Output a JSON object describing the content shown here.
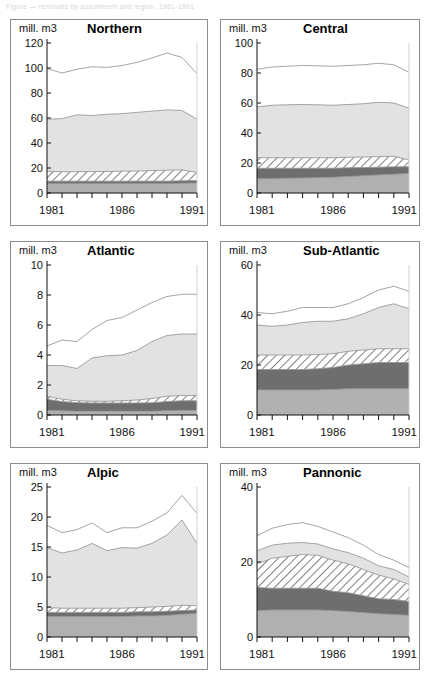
{
  "caption": {
    "text": "Figure — removals by assortment and region, 1981-1991"
  },
  "figure": {
    "unit_label": "mill. m3",
    "x_axis_ticks": [
      "1981",
      "1986",
      "1991"
    ],
    "x_years": [
      1981,
      1982,
      1983,
      1984,
      1985,
      1986,
      1987,
      1988,
      1989,
      1990,
      1991
    ],
    "palette": {
      "layer1_medium_gray": "#b0b0b0",
      "layer2_dark_gray": "#6e6e6e",
      "layer3_hatched": "#ffffff",
      "layer4_light_gray": "#e2e2e2",
      "layer5_white": "#ffffff",
      "outline": "#9a9a9a",
      "panel_border": "#8d8d8d",
      "axis": "#111111"
    },
    "layer_names": [
      "layer-1",
      "layer-2",
      "layer-3-hatched",
      "layer-4",
      "layer-5"
    ]
  },
  "chart_data": [
    {
      "type": "area",
      "title": "Northern",
      "ylabel": "mill. m3",
      "xlabel": "",
      "x": [
        1981,
        1982,
        1983,
        1984,
        1985,
        1986,
        1987,
        1988,
        1989,
        1990,
        1991
      ],
      "ylim": [
        0,
        120
      ],
      "yticks": [
        0,
        20,
        40,
        60,
        80,
        100,
        120
      ],
      "xticks": [
        1981,
        1986,
        1991
      ],
      "grid": false,
      "stacked": true,
      "series": [
        {
          "name": "layer-1",
          "values": [
            7.5,
            7.5,
            7.5,
            7.5,
            7.5,
            7.5,
            7.5,
            7.5,
            7.5,
            7.8,
            8.0
          ]
        },
        {
          "name": "layer-2",
          "values": [
            9.5,
            9.5,
            9.5,
            9.5,
            9.5,
            9.5,
            9.5,
            9.5,
            9.5,
            9.8,
            10.0
          ]
        },
        {
          "name": "layer-3-hatched",
          "values": [
            17.5,
            17.0,
            17.0,
            17.2,
            17.2,
            17.5,
            17.5,
            18.0,
            18.2,
            18.5,
            16.5
          ]
        },
        {
          "name": "layer-4",
          "values": [
            59.0,
            59.5,
            62.5,
            62.0,
            63.0,
            63.5,
            64.5,
            65.5,
            66.5,
            66.0,
            59.0
          ]
        },
        {
          "name": "layer-5",
          "values": [
            99.5,
            96.0,
            99.0,
            101.0,
            100.5,
            102.0,
            104.5,
            108.0,
            112.0,
            108.5,
            95.5
          ]
        }
      ],
      "cumulative_top_values": {
        "layer-1": [
          7.5,
          7.5,
          7.5,
          7.5,
          7.5,
          7.5,
          7.5,
          7.5,
          7.5,
          7.8,
          8.0
        ],
        "layer-5": [
          99.5,
          96.0,
          99.0,
          101.0,
          100.5,
          102.0,
          104.5,
          108.0,
          112.0,
          108.5,
          95.5
        ]
      }
    },
    {
      "type": "area",
      "title": "Central",
      "ylabel": "mill. m3",
      "xlabel": "",
      "x": [
        1981,
        1982,
        1983,
        1984,
        1985,
        1986,
        1987,
        1988,
        1989,
        1990,
        1991
      ],
      "ylim": [
        0,
        100
      ],
      "yticks": [
        0,
        20,
        40,
        60,
        80,
        100
      ],
      "xticks": [
        1981,
        1986,
        1991
      ],
      "grid": false,
      "stacked": true,
      "series": [
        {
          "name": "layer-1",
          "values": [
            9.5,
            9.5,
            9.8,
            10.0,
            10.2,
            10.5,
            11.0,
            11.5,
            12.0,
            12.5,
            13.0
          ]
        },
        {
          "name": "layer-2",
          "values": [
            16.5,
            16.5,
            16.5,
            16.5,
            16.5,
            16.5,
            16.8,
            17.0,
            17.2,
            17.5,
            17.5
          ]
        },
        {
          "name": "layer-3-hatched",
          "values": [
            23.5,
            23.5,
            23.5,
            23.5,
            23.5,
            23.5,
            23.8,
            24.0,
            24.2,
            24.5,
            22.0
          ]
        },
        {
          "name": "layer-4",
          "values": [
            57.5,
            58.5,
            58.8,
            59.0,
            58.8,
            58.5,
            59.0,
            59.5,
            60.5,
            60.0,
            56.5
          ]
        },
        {
          "name": "layer-5",
          "values": [
            82.5,
            84.0,
            84.5,
            85.0,
            84.8,
            84.5,
            85.0,
            85.5,
            86.5,
            85.5,
            80.5
          ]
        }
      ]
    },
    {
      "type": "area",
      "title": "Atlantic",
      "ylabel": "mill. m3",
      "xlabel": "",
      "x": [
        1981,
        1982,
        1983,
        1984,
        1985,
        1986,
        1987,
        1988,
        1989,
        1990,
        1991
      ],
      "ylim": [
        0,
        10
      ],
      "yticks": [
        0,
        2,
        4,
        6,
        8,
        10
      ],
      "xticks": [
        1981,
        1986,
        1991
      ],
      "grid": false,
      "stacked": true,
      "series": [
        {
          "name": "layer-1",
          "values": [
            0.3,
            0.28,
            0.25,
            0.25,
            0.25,
            0.25,
            0.25,
            0.25,
            0.28,
            0.3,
            0.3
          ]
        },
        {
          "name": "layer-2",
          "values": [
            1.05,
            0.9,
            0.82,
            0.8,
            0.8,
            0.8,
            0.8,
            0.82,
            0.9,
            0.95,
            0.95
          ]
        },
        {
          "name": "layer-3-hatched",
          "values": [
            1.25,
            1.05,
            0.95,
            0.92,
            0.92,
            0.95,
            1.0,
            1.1,
            1.25,
            1.3,
            1.3
          ]
        },
        {
          "name": "layer-4",
          "values": [
            3.3,
            3.3,
            3.1,
            3.8,
            3.95,
            4.0,
            4.3,
            4.9,
            5.3,
            5.4,
            5.4
          ]
        },
        {
          "name": "layer-5",
          "values": [
            4.6,
            5.0,
            4.9,
            5.7,
            6.3,
            6.5,
            7.0,
            7.5,
            7.9,
            8.05,
            8.05
          ]
        }
      ]
    },
    {
      "type": "area",
      "title": "Sub-Atlantic",
      "ylabel": "mill. m3",
      "xlabel": "",
      "x": [
        1981,
        1982,
        1983,
        1984,
        1985,
        1986,
        1987,
        1988,
        1989,
        1990,
        1991
      ],
      "ylim": [
        0,
        60
      ],
      "yticks": [
        0,
        20,
        40,
        60
      ],
      "xticks": [
        1981,
        1986,
        1991
      ],
      "grid": false,
      "stacked": true,
      "series": [
        {
          "name": "layer-1",
          "values": [
            10.0,
            10.0,
            10.0,
            10.0,
            10.0,
            10.2,
            10.5,
            10.5,
            10.5,
            10.5,
            10.5
          ]
        },
        {
          "name": "layer-2",
          "values": [
            18.2,
            18.2,
            18.2,
            18.2,
            18.5,
            19.0,
            20.0,
            20.5,
            21.0,
            21.0,
            21.0
          ]
        },
        {
          "name": "layer-3-hatched",
          "values": [
            24.0,
            24.0,
            24.0,
            24.0,
            24.2,
            24.5,
            25.5,
            26.0,
            26.5,
            26.5,
            26.5
          ]
        },
        {
          "name": "layer-4",
          "values": [
            36.0,
            35.5,
            36.0,
            37.0,
            37.5,
            37.5,
            38.5,
            40.5,
            43.0,
            44.5,
            42.5
          ]
        },
        {
          "name": "layer-5",
          "values": [
            41.0,
            40.5,
            41.5,
            43.0,
            43.0,
            43.0,
            44.5,
            47.0,
            50.0,
            51.5,
            49.5
          ]
        }
      ]
    },
    {
      "type": "area",
      "title": "Alpic",
      "ylabel": "mill. m3",
      "xlabel": "",
      "x": [
        1981,
        1982,
        1983,
        1984,
        1985,
        1986,
        1987,
        1988,
        1989,
        1990,
        1991
      ],
      "ylim": [
        0,
        25
      ],
      "yticks": [
        0,
        5,
        10,
        15,
        20,
        25
      ],
      "xticks": [
        1981,
        1986,
        1991
      ],
      "grid": false,
      "stacked": true,
      "series": [
        {
          "name": "layer-1",
          "values": [
            3.4,
            3.4,
            3.4,
            3.4,
            3.4,
            3.4,
            3.5,
            3.5,
            3.6,
            3.8,
            3.9
          ]
        },
        {
          "name": "layer-2",
          "values": [
            4.1,
            4.1,
            4.1,
            4.1,
            4.1,
            4.1,
            4.2,
            4.2,
            4.3,
            4.4,
            4.5
          ]
        },
        {
          "name": "layer-3-hatched",
          "values": [
            4.9,
            4.8,
            4.8,
            4.8,
            4.8,
            4.8,
            4.9,
            5.0,
            5.1,
            5.3,
            5.2
          ]
        },
        {
          "name": "layer-4",
          "values": [
            14.9,
            14.0,
            14.5,
            15.6,
            14.4,
            14.9,
            14.8,
            15.6,
            17.0,
            19.5,
            15.6
          ]
        },
        {
          "name": "layer-5",
          "values": [
            18.6,
            17.4,
            17.9,
            19.0,
            17.4,
            18.2,
            18.2,
            19.3,
            20.7,
            23.6,
            20.6
          ]
        }
      ]
    },
    {
      "type": "area",
      "title": "Pannonic",
      "ylabel": "mill. m3",
      "xlabel": "",
      "x": [
        1981,
        1982,
        1983,
        1984,
        1985,
        1986,
        1987,
        1988,
        1989,
        1990,
        1991
      ],
      "ylim": [
        0,
        40
      ],
      "yticks": [
        0,
        20,
        40
      ],
      "xticks": [
        1981,
        1986,
        1991
      ],
      "grid": false,
      "stacked": true,
      "series": [
        {
          "name": "layer-1",
          "values": [
            7.0,
            7.2,
            7.2,
            7.2,
            7.2,
            7.0,
            6.8,
            6.5,
            6.2,
            6.0,
            5.8
          ]
        },
        {
          "name": "layer-2",
          "values": [
            13.2,
            13.0,
            13.0,
            13.0,
            13.0,
            12.2,
            11.8,
            11.0,
            10.2,
            10.0,
            9.5
          ]
        },
        {
          "name": "layer-3-hatched",
          "values": [
            19.5,
            21.0,
            21.5,
            22.0,
            21.8,
            20.5,
            19.5,
            18.0,
            16.5,
            15.5,
            14.0
          ]
        },
        {
          "name": "layer-4",
          "values": [
            23.0,
            24.5,
            25.0,
            25.2,
            24.8,
            23.5,
            22.5,
            21.0,
            19.0,
            18.0,
            16.0
          ]
        },
        {
          "name": "layer-5",
          "values": [
            27.0,
            29.0,
            30.0,
            30.5,
            29.5,
            28.0,
            26.5,
            24.5,
            22.0,
            20.5,
            18.5
          ]
        }
      ]
    }
  ]
}
